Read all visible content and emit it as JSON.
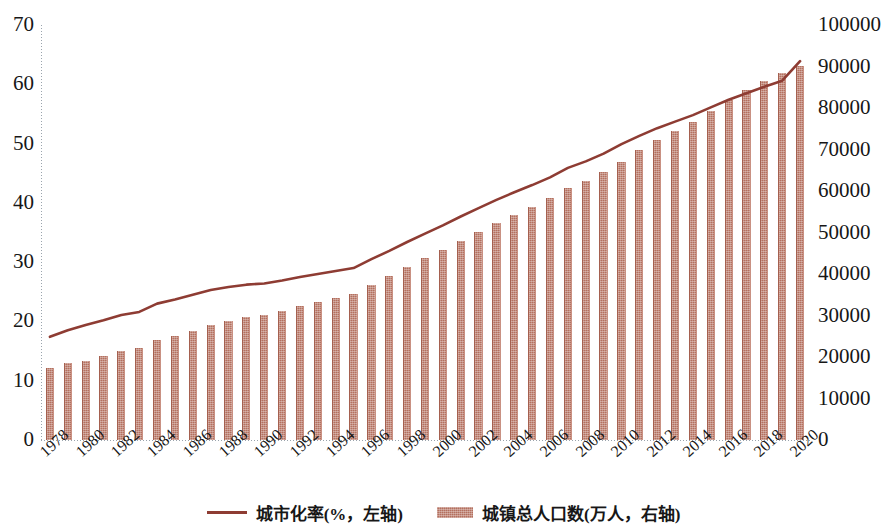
{
  "chart_data": {
    "type": "bar",
    "title": "",
    "subtitle": "",
    "xlabel": "",
    "ylabel": "",
    "grid": false,
    "legend_position": "bottom-center",
    "colors": {
      "bar": "#b4705f",
      "line": "#8e3c33",
      "axis": "#9aa4ad",
      "text": "#171717"
    },
    "x": [
      1978,
      1979,
      1980,
      1981,
      1982,
      1983,
      1984,
      1985,
      1986,
      1987,
      1988,
      1989,
      1990,
      1991,
      1992,
      1993,
      1994,
      1995,
      1996,
      1997,
      1998,
      1999,
      2000,
      2001,
      2002,
      2003,
      2004,
      2005,
      2006,
      2007,
      2008,
      2009,
      2010,
      2011,
      2012,
      2013,
      2014,
      2015,
      2016,
      2017,
      2018,
      2019,
      2020
    ],
    "xtick_labels": [
      "1978",
      "1980",
      "1982",
      "1984",
      "1986",
      "1988",
      "1990",
      "1992",
      "1994",
      "1996",
      "1998",
      "2000",
      "2002",
      "2004",
      "2006",
      "2008",
      "2010",
      "2012",
      "2014",
      "2016",
      "2018",
      "2020"
    ],
    "xtick_values": [
      1978,
      1980,
      1982,
      1984,
      1986,
      1988,
      1990,
      1992,
      1994,
      1996,
      1998,
      2000,
      2002,
      2004,
      2006,
      2008,
      2010,
      2012,
      2014,
      2016,
      2018,
      2020
    ],
    "left_axis": {
      "label": "城市化率(%，左轴)",
      "ylim": [
        0,
        70
      ],
      "ticks": [
        0,
        10,
        20,
        30,
        40,
        50,
        60,
        70
      ],
      "tick_labels": [
        "0",
        "10",
        "20",
        "30",
        "40",
        "50",
        "60",
        "70"
      ]
    },
    "right_axis": {
      "label": "城镇总人口数(万人，右轴)",
      "ylim": [
        0,
        100000
      ],
      "ticks": [
        0,
        10000,
        20000,
        30000,
        40000,
        50000,
        60000,
        70000,
        80000,
        90000,
        100000
      ],
      "tick_labels": [
        "0",
        "10000",
        "20000",
        "30000",
        "40000",
        "50000",
        "60000",
        "70000",
        "80000",
        "90000",
        "100000"
      ]
    },
    "series": [
      {
        "name": "城市化率(%，左轴)",
        "type": "line",
        "axis": "left",
        "unit": "%",
        "color": "#8e3c33",
        "values": [
          17.4,
          18.5,
          19.4,
          20.2,
          21.1,
          21.6,
          23.0,
          23.7,
          24.5,
          25.3,
          25.8,
          26.2,
          26.4,
          26.9,
          27.5,
          28.0,
          28.5,
          29.0,
          30.5,
          31.9,
          33.4,
          34.8,
          36.2,
          37.7,
          39.1,
          40.5,
          41.8,
          43.0,
          44.3,
          45.9,
          47.0,
          48.3,
          49.9,
          51.3,
          52.6,
          53.7,
          54.8,
          56.1,
          57.4,
          58.5,
          59.6,
          60.6,
          63.9
        ]
      },
      {
        "name": "城镇总人口数(万人，右轴)",
        "type": "bar",
        "axis": "right",
        "unit": "万人",
        "color": "#b4705f",
        "values": [
          17245,
          18495,
          19140,
          20171,
          21480,
          22274,
          24017,
          25094,
          26366,
          27674,
          28661,
          29540,
          30195,
          31203,
          32175,
          33173,
          34169,
          35174,
          37304,
          39449,
          41608,
          43748,
          45906,
          48064,
          50212,
          52376,
          54283,
          56212,
          58288,
          60633,
          62403,
          64512,
          66978,
          69927,
          72175,
          74502,
          76738,
          79302,
          81924,
          84343,
          86433,
          88426,
          90220
        ]
      }
    ]
  }
}
